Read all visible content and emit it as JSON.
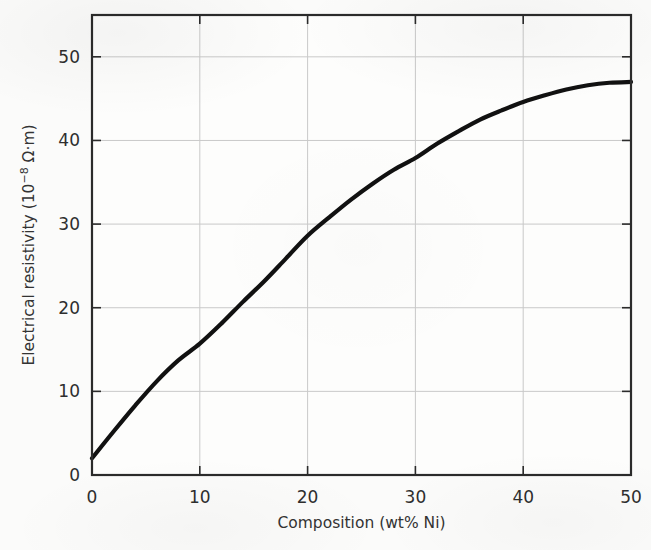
{
  "figure": {
    "background_color": "#fbfbfa",
    "plot_frame_color": "#2b2b2b",
    "grid_color": "#c9c9c9",
    "curve_color": "#111111"
  },
  "chart_data": {
    "type": "line",
    "title": "",
    "xlabel": "Composition (wt% Ni)",
    "ylabel": "Electrical resistivity (10−8 Ω·m)",
    "ylabel_parts": {
      "prefix": "Electrical resistivity (10",
      "exponent": "−8",
      "suffix": " Ω·m)"
    },
    "xlim": [
      0,
      50
    ],
    "ylim": [
      0,
      55
    ],
    "xticks": [
      0,
      10,
      20,
      30,
      40,
      50
    ],
    "xtick_labels": [
      "0",
      "10",
      "20",
      "30",
      "40",
      "50"
    ],
    "yticks": [
      0,
      10,
      20,
      30,
      40,
      50
    ],
    "ytick_labels": [
      "0",
      "10",
      "20",
      "30",
      "40",
      "50"
    ],
    "grid": true,
    "grid_axes": "both",
    "legend": false,
    "legend_position": "none",
    "series": [
      {
        "name": "Cu–Ni alloy resistivity",
        "x": [
          0,
          2,
          4,
          6,
          8,
          10,
          12,
          14,
          16,
          18,
          20,
          22,
          24,
          26,
          28,
          30,
          32,
          34,
          36,
          38,
          40,
          42,
          44,
          46,
          48,
          50
        ],
        "values": [
          2.0,
          5.2,
          8.3,
          11.2,
          13.7,
          15.7,
          18.1,
          20.7,
          23.2,
          25.9,
          28.6,
          30.8,
          32.9,
          34.8,
          36.5,
          37.9,
          39.6,
          41.1,
          42.5,
          43.6,
          44.6,
          45.4,
          46.1,
          46.6,
          46.9,
          47.0
        ]
      }
    ],
    "annotations": []
  }
}
